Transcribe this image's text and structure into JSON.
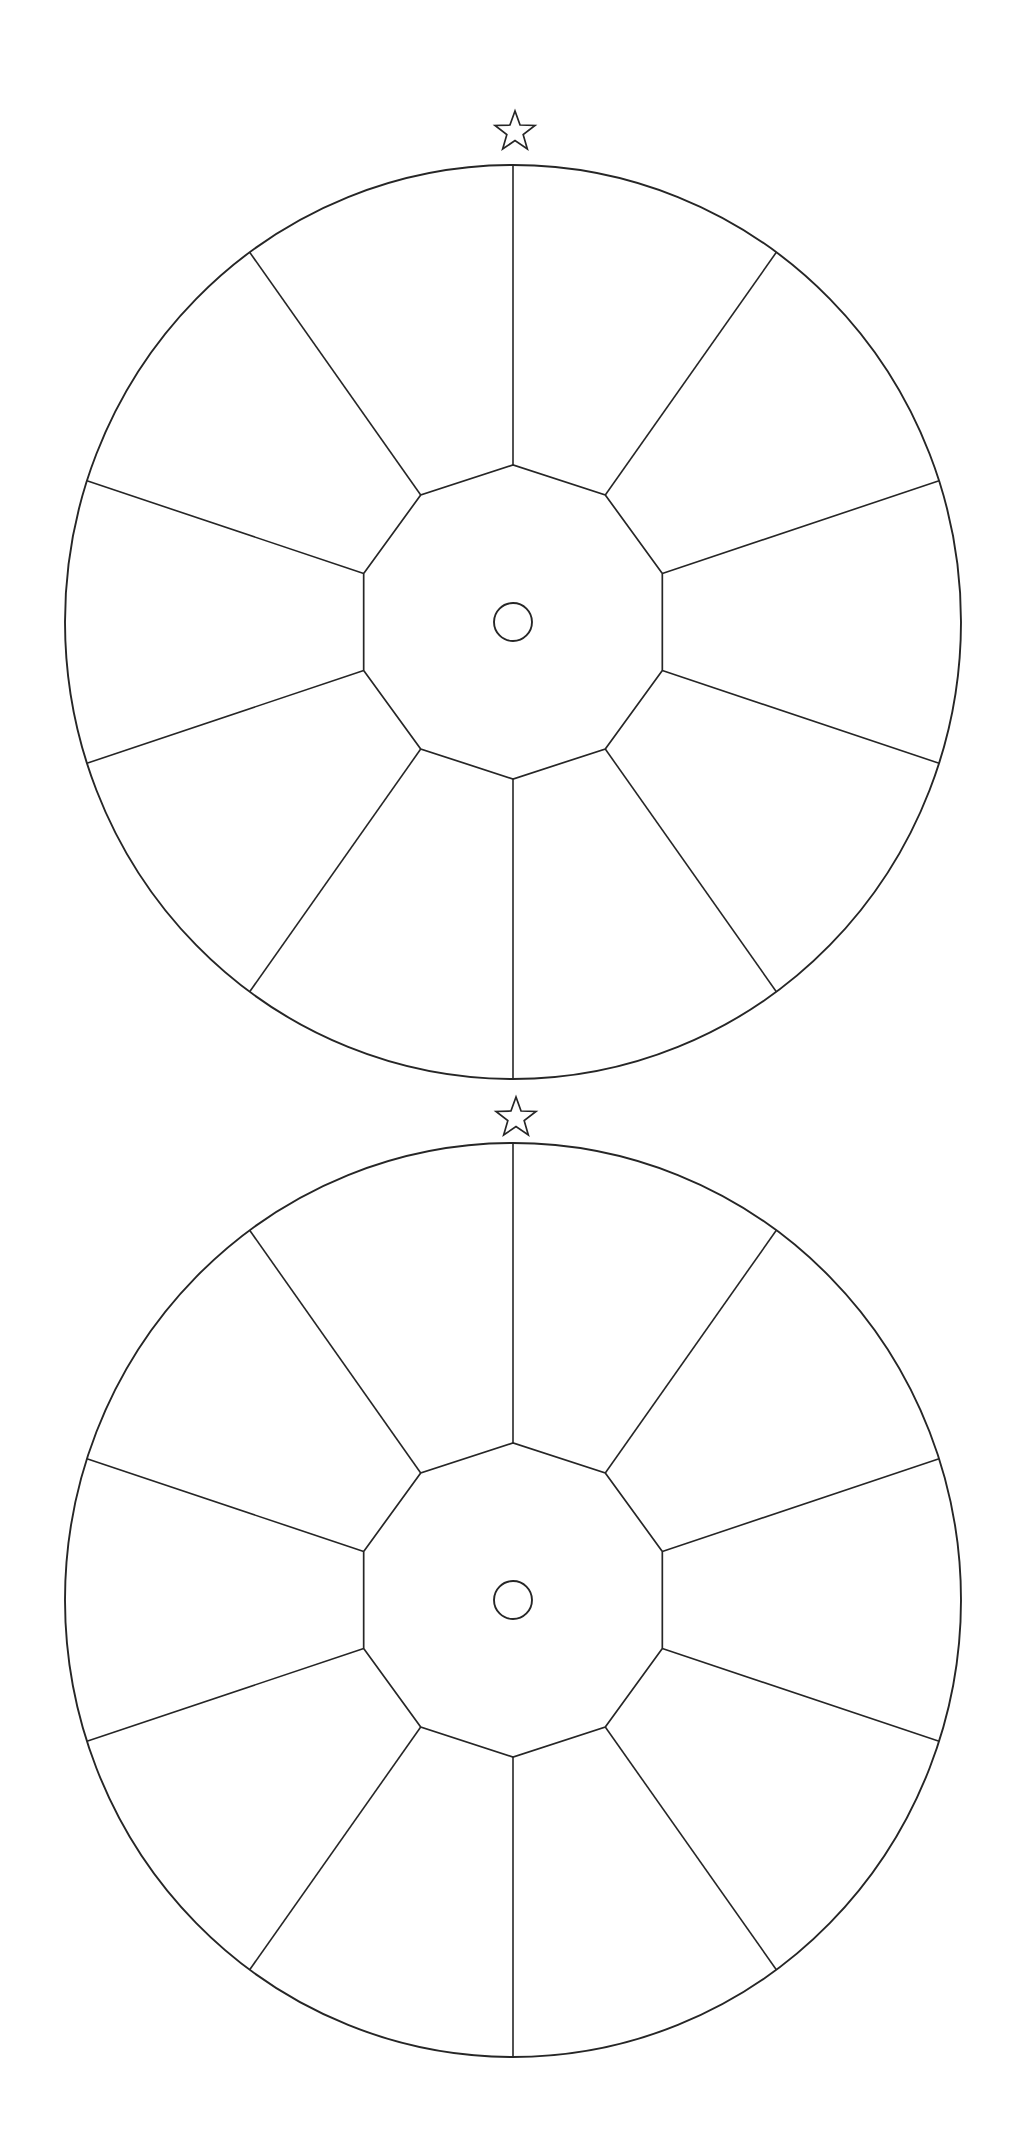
{
  "page": {
    "background_color": "#ffffff",
    "stroke_color": "#262626",
    "width": 1030,
    "height": 2147
  },
  "chart_data": {
    "type": "pie",
    "title": "",
    "xlabel": "",
    "ylabel": "",
    "grid": false,
    "legend": "none",
    "categories": [
      "1",
      "2",
      "3",
      "4",
      "5",
      "6",
      "7",
      "8",
      "9",
      "10"
    ],
    "values": [
      10,
      10,
      10,
      10,
      10,
      10,
      10,
      10,
      10,
      10
    ],
    "labels": [
      "",
      "",
      "",
      "",
      "",
      "",
      "",
      "",
      "",
      ""
    ],
    "slice_count": 10,
    "slice_angle_degrees": 36,
    "start_angle_degrees": 72,
    "units": "percent",
    "annotations": [
      "star-marker-top-wheel",
      "star-marker-bottom-wheel"
    ]
  },
  "wheels": [
    {
      "id": "wheel-top",
      "name": "Top Wheel",
      "center_x": 513,
      "center_y": 622,
      "radius_x": 448,
      "radius_y": 457,
      "hub_radius": 157,
      "axle_radius": 19,
      "segments": 10,
      "spoke_offset_degrees": 18,
      "star": {
        "name": "top-marker-star",
        "center_x": 515,
        "center_y": 132,
        "outer_radius": 21,
        "inner_radius": 8.6,
        "points": 5
      }
    },
    {
      "id": "wheel-bottom",
      "name": "Bottom Wheel",
      "center_x": 513,
      "center_y": 1600,
      "radius_x": 448,
      "radius_y": 457,
      "hub_radius": 157,
      "axle_radius": 19,
      "segments": 10,
      "spoke_offset_degrees": 18,
      "star": {
        "name": "bottom-marker-star",
        "center_x": 516,
        "center_y": 1118,
        "outer_radius": 21,
        "inner_radius": 8.6,
        "points": 5
      }
    }
  ]
}
